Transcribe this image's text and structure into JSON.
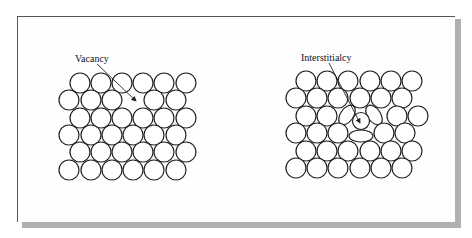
{
  "figure": {
    "left_panel": {
      "label": "Vacancy",
      "rows": [
        {
          "y": 83,
          "x": [
            80,
            101,
            122,
            143,
            164,
            186
          ]
        },
        {
          "y": 100,
          "x": [
            69,
            91,
            112,
            154,
            176
          ]
        },
        {
          "y": 118,
          "x": [
            80,
            101,
            122,
            143,
            164,
            186
          ]
        },
        {
          "y": 135,
          "x": [
            69,
            91,
            112,
            133,
            154,
            176
          ]
        },
        {
          "y": 152,
          "x": [
            80,
            101,
            122,
            143,
            164,
            186
          ]
        },
        {
          "y": 170,
          "x": [
            69,
            91,
            112,
            133,
            154,
            176
          ]
        }
      ]
    },
    "right_panel": {
      "label": "Interstitialcy"
    },
    "colors": {
      "stroke": "#222222",
      "shadow": "#b0b0b0",
      "background": "#ffffff"
    }
  }
}
